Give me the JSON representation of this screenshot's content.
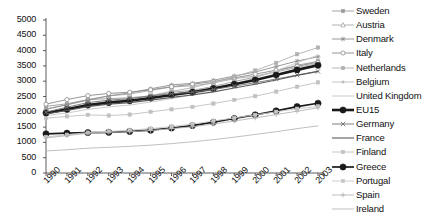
{
  "chart_data": {
    "type": "line",
    "title": "",
    "xlabel": "",
    "ylabel": "",
    "x": [
      1990,
      1991,
      1992,
      1993,
      1994,
      1995,
      1996,
      1997,
      1998,
      1999,
      2000,
      2001,
      2002,
      2003
    ],
    "categories": [
      "1990",
      "1991",
      "1992",
      "1993",
      "1994",
      "1995",
      "1996",
      "1997",
      "1998",
      "1999",
      "2000",
      "2001",
      "2002",
      "2003"
    ],
    "ylim": [
      0,
      5000
    ],
    "ytick_values": [
      0,
      500,
      1000,
      1500,
      2000,
      2500,
      3000,
      3500,
      4000,
      4500,
      5000
    ],
    "ytick_labels": [
      "0",
      "500",
      "1000",
      "1500",
      "2000",
      "2500",
      "3000",
      "3500",
      "4000",
      "4500",
      "5000"
    ],
    "grid": false,
    "legend_position": "right",
    "series": [
      {
        "name": "Sweden",
        "marker": "square-small",
        "color": "#9a9a9a",
        "width": 0.9,
        "values": [
          2180,
          2260,
          2400,
          2430,
          2460,
          2520,
          2640,
          2700,
          2830,
          2990,
          3130,
          3330,
          3520,
          3650
        ]
      },
      {
        "name": "Austria",
        "marker": "triangle",
        "color": "#a8a8a8",
        "width": 0.9,
        "values": [
          2100,
          2230,
          2400,
          2520,
          2580,
          2700,
          2810,
          2850,
          2940,
          3080,
          3170,
          3300,
          3450,
          3580
        ]
      },
      {
        "name": "Denmark",
        "marker": "star",
        "color": "#8e8e8e",
        "width": 0.9,
        "values": [
          2080,
          2230,
          2380,
          2520,
          2620,
          2750,
          2880,
          2930,
          3030,
          3170,
          3300,
          3480,
          3660,
          3800
        ]
      },
      {
        "name": "Italy",
        "marker": "circle-open",
        "color": "#8a8a8a",
        "width": 0.9,
        "values": [
          2250,
          2400,
          2530,
          2600,
          2640,
          2720,
          2820,
          2900,
          2990,
          3110,
          3230,
          3360,
          3490,
          3620
        ]
      },
      {
        "name": "Netherlands",
        "marker": "square-small",
        "color": "#b0b0b0",
        "width": 0.9,
        "values": [
          1960,
          2080,
          2230,
          2340,
          2420,
          2530,
          2670,
          2790,
          2960,
          3150,
          3350,
          3600,
          3880,
          4100
        ]
      },
      {
        "name": "Belgium",
        "marker": "dot-small",
        "color": "#bdbdbd",
        "width": 0.9,
        "values": [
          1950,
          2060,
          2190,
          2290,
          2350,
          2440,
          2540,
          2630,
          2750,
          2890,
          3040,
          3200,
          3380,
          3530
        ]
      },
      {
        "name": "United Kingdom",
        "marker": "none",
        "color": "#c4c4c4",
        "width": 0.9,
        "values": [
          1880,
          1960,
          2080,
          2160,
          2220,
          2320,
          2430,
          2560,
          2720,
          2900,
          3110,
          3340,
          3600,
          3850
        ]
      },
      {
        "name": "EU15",
        "marker": "circle-fill",
        "color": "#1a1a1a",
        "width": 2.6,
        "values": [
          1960,
          2080,
          2220,
          2300,
          2360,
          2450,
          2550,
          2640,
          2760,
          2900,
          3040,
          3200,
          3370,
          3520
        ]
      },
      {
        "name": "Germany",
        "marker": "x",
        "color": "#6f6f6f",
        "width": 0.9,
        "values": [
          1990,
          2150,
          2300,
          2380,
          2430,
          2520,
          2590,
          2640,
          2730,
          2840,
          2950,
          3070,
          3200,
          3320
        ]
      },
      {
        "name": "France",
        "marker": "none",
        "color": "#5c5c5c",
        "width": 1.1,
        "values": [
          1930,
          2040,
          2170,
          2250,
          2300,
          2380,
          2470,
          2550,
          2650,
          2780,
          2900,
          3040,
          3190,
          3320
        ]
      },
      {
        "name": "Finland",
        "marker": "square-small",
        "color": "#c0c0c0",
        "width": 0.9,
        "values": [
          1790,
          1850,
          1900,
          1880,
          1910,
          2000,
          2080,
          2160,
          2270,
          2390,
          2510,
          2660,
          2820,
          2960
        ]
      },
      {
        "name": "Greece",
        "marker": "circle-fill",
        "color": "#1a1a1a",
        "width": 1.7,
        "values": [
          1280,
          1300,
          1320,
          1330,
          1360,
          1400,
          1470,
          1550,
          1660,
          1780,
          1900,
          2030,
          2170,
          2280
        ]
      },
      {
        "name": "Portugal",
        "marker": "square-small",
        "color": "#c8c8c8",
        "width": 0.9,
        "values": [
          1180,
          1250,
          1320,
          1360,
          1400,
          1450,
          1520,
          1600,
          1700,
          1800,
          1900,
          2000,
          2100,
          2180
        ]
      },
      {
        "name": "Spain",
        "marker": "plus",
        "color": "#b5b5b5",
        "width": 0.9,
        "values": [
          1150,
          1220,
          1300,
          1330,
          1350,
          1390,
          1450,
          1510,
          1600,
          1700,
          1800,
          1910,
          2020,
          2130
        ]
      },
      {
        "name": "Ireland",
        "marker": "none",
        "color": "#b8b8b8",
        "width": 0.9,
        "values": [
          720,
          760,
          810,
          840,
          870,
          910,
          960,
          1020,
          1090,
          1170,
          1260,
          1350,
          1450,
          1540
        ]
      }
    ]
  },
  "legend": {
    "items": [
      {
        "label": "Sweden"
      },
      {
        "label": "Austria"
      },
      {
        "label": "Denmark"
      },
      {
        "label": "Italy"
      },
      {
        "label": "Netherlands"
      },
      {
        "label": "Belgium"
      },
      {
        "label": "United Kingdom"
      },
      {
        "label": "EU15"
      },
      {
        "label": "Germany"
      },
      {
        "label": "France"
      },
      {
        "label": "Finland"
      },
      {
        "label": "Greece"
      },
      {
        "label": "Portugal"
      },
      {
        "label": "Spain"
      },
      {
        "label": "Ireland"
      }
    ]
  },
  "colors": {
    "axis": "#4a4a4a",
    "text": "#111111",
    "background": "#ffffff",
    "highlight": "#1a1a1a"
  }
}
